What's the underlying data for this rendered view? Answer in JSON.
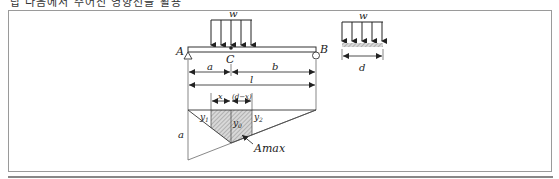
{
  "caption": "답 다음에서 주어진 영향선을 활용",
  "diagram": {
    "beam": {
      "load_label": "w",
      "support_left": "A",
      "support_right": "B",
      "point": "C",
      "dim_a": "a",
      "dim_b": "b",
      "dim_l": "l"
    },
    "load_detail": {
      "load_label": "w",
      "width_label": "d"
    },
    "influence_line": {
      "dim_x": "x",
      "dim_dx": "(d−x)",
      "y1": "y",
      "y1_sub": "1",
      "y0": "y",
      "y0_sub": "0",
      "y2": "y",
      "y2_sub": "2",
      "ordinate_label": "a",
      "area_label": "Amax"
    }
  }
}
